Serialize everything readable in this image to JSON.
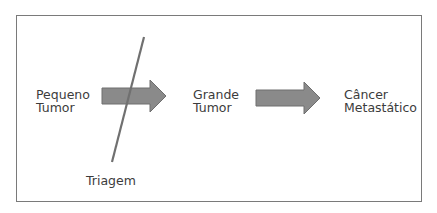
{
  "diagram": {
    "nodes": [
      {
        "id": "small",
        "line1": "Pequeno",
        "line2": "Tumor"
      },
      {
        "id": "large",
        "line1": "Grande",
        "line2": "Tumor"
      },
      {
        "id": "metastatic",
        "line1": "Câncer",
        "line2": "Metastático"
      }
    ],
    "screening_label": "Triagem",
    "edges": [
      {
        "from": "small",
        "to": "large",
        "intercepted_by": "Triagem"
      },
      {
        "from": "large",
        "to": "metastatic"
      }
    ],
    "colors": {
      "arrow_fill": "#8a8a8a",
      "arrow_stroke": "#6e6e6e",
      "line": "#707070",
      "frame": "#7a7a7a"
    }
  }
}
